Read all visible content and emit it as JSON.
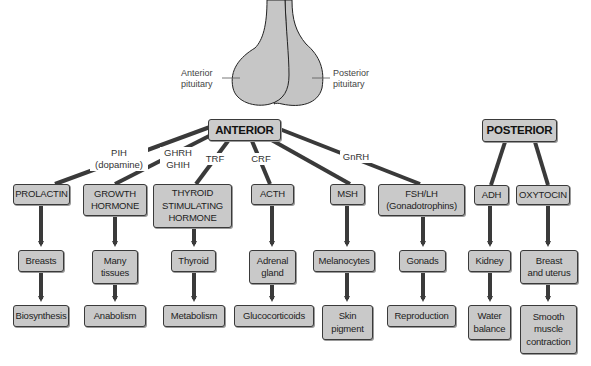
{
  "gland": {
    "anterior_label": "Anterior\npituitary",
    "anterior_line1": "Anterior",
    "anterior_line2": "pituitary",
    "posterior_line1": "Posterior",
    "posterior_line2": "pituitary",
    "fill_color": "#c4c4c4"
  },
  "headers": {
    "anterior": "ANTERIOR",
    "posterior": "POSTERIOR"
  },
  "releasing_factors": {
    "pih_line1": "PIH",
    "pih_line2": "(dopamine)",
    "ghrh": "GHRH",
    "ghih": "GHIH",
    "trf": "TRF",
    "crf": "CRF",
    "gnrh": "GnRH"
  },
  "hormones": [
    {
      "line1": "PROLACTIN",
      "line2": "",
      "line3": ""
    },
    {
      "line1": "GROWTH",
      "line2": "HORMONE",
      "line3": ""
    },
    {
      "line1": "THYROID",
      "line2": "STIMULATING",
      "line3": "HORMONE"
    },
    {
      "line1": "ACTH",
      "line2": "",
      "line3": ""
    },
    {
      "line1": "MSH",
      "line2": "",
      "line3": ""
    },
    {
      "line1": "FSH/LH",
      "line2": "(Gonadotrophins)",
      "line3": ""
    },
    {
      "line1": "ADH",
      "line2": "",
      "line3": ""
    },
    {
      "line1": "OXYTOCIN",
      "line2": "",
      "line3": ""
    }
  ],
  "targets": [
    {
      "line1": "Breasts",
      "line2": ""
    },
    {
      "line1": "Many",
      "line2": "tissues"
    },
    {
      "line1": "Thyroid",
      "line2": ""
    },
    {
      "line1": "Adrenal",
      "line2": "gland"
    },
    {
      "line1": "Melanocytes",
      "line2": ""
    },
    {
      "line1": "Gonads",
      "line2": ""
    },
    {
      "line1": "Kidney",
      "line2": ""
    },
    {
      "line1": "Breast",
      "line2": "and uterus"
    }
  ],
  "effects": [
    {
      "line1": "Biosynthesis",
      "line2": "",
      "line3": ""
    },
    {
      "line1": "Anabolism",
      "line2": "",
      "line3": ""
    },
    {
      "line1": "Metabolism",
      "line2": "",
      "line3": ""
    },
    {
      "line1": "Glucocorticoids",
      "line2": "",
      "line3": ""
    },
    {
      "line1": "Skin",
      "line2": "pigment",
      "line3": ""
    },
    {
      "line1": "Reproduction",
      "line2": "",
      "line3": ""
    },
    {
      "line1": "Water",
      "line2": "balance",
      "line3": ""
    },
    {
      "line1": "Smooth",
      "line2": "muscle",
      "line3": "contraction"
    }
  ],
  "colors": {
    "box_fill": "#c9c9c9",
    "box_border": "#3a3a3a",
    "connector": "#3a3a3a"
  }
}
